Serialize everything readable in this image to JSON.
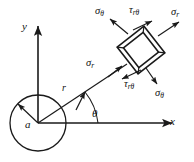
{
  "figure": {
    "background_color": "#ffffff",
    "line_color": "#1a1a1a"
  },
  "axes": {
    "x_label": "x",
    "y_label": "y",
    "origin": {
      "x": 38,
      "y": 123
    },
    "x_axis_end": {
      "x": 176,
      "y": 123
    },
    "y_axis_end": {
      "x": 38,
      "y": 22
    }
  },
  "hole": {
    "radius_label": "a",
    "center": {
      "x": 38,
      "y": 123
    },
    "radius_px": 28
  },
  "radial": {
    "r_label": "r",
    "theta_label": "θ",
    "angle_degrees": 38,
    "length_px": 105
  },
  "element": {
    "center": {
      "x": 141,
      "y": 50
    },
    "rotation_degrees": 38,
    "half_size_px": 16,
    "faces": [
      {
        "id": "outer-radial",
        "label": "σ",
        "sub": "r",
        "name": "sigma-r-outer"
      },
      {
        "id": "inner-radial",
        "label": "σ",
        "sub": "r",
        "name": "sigma-r-inner"
      },
      {
        "id": "upper-hoop",
        "label": "σ",
        "sub": "θ",
        "name": "sigma-theta-upper"
      },
      {
        "id": "lower-hoop",
        "label": "σ",
        "sub": "θ",
        "name": "sigma-theta-lower"
      },
      {
        "id": "upper-shear",
        "label": "τ",
        "sub": "rθ",
        "name": "tau-r-theta-upper"
      },
      {
        "id": "lower-shear",
        "label": "τ",
        "sub": "rθ",
        "name": "tau-r-theta-lower"
      }
    ]
  },
  "labels": {
    "sigma_theta_top_left": {
      "glyph": "σ",
      "sub": "θ"
    },
    "tau_r_theta_top": {
      "glyph": "τ",
      "sub": "rθ"
    },
    "sigma_r_top_right": {
      "glyph": "σ",
      "sub": "r"
    },
    "sigma_r_left": {
      "glyph": "σ",
      "sub": "r"
    },
    "tau_r_theta_bottom": {
      "glyph": "τ",
      "sub": "rθ"
    },
    "sigma_theta_bottom": {
      "glyph": "σ",
      "sub": "θ"
    }
  }
}
